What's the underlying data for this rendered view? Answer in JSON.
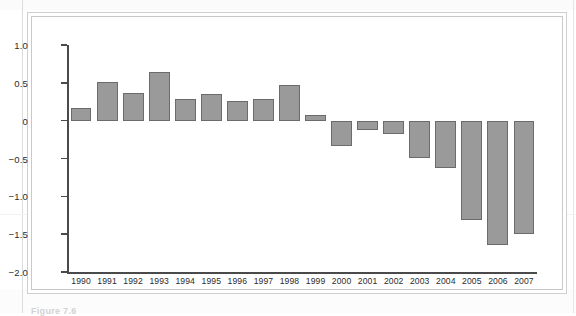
{
  "caption": "Figure 7.6",
  "colors": {
    "bar_fill": "#9a9a9a",
    "bar_stroke": "#6b6b6b",
    "axis": "#4a4a4a",
    "frame": "#cfcfcf",
    "text": "#2b2b2b",
    "page_background": "#ffffff"
  },
  "chart_data": {
    "type": "bar",
    "title": "",
    "subtitle": "",
    "xlabel": "",
    "ylabel": "",
    "categories": [
      "1990",
      "1991",
      "1992",
      "1993",
      "1994",
      "1995",
      "1996",
      "1997",
      "1998",
      "1999",
      "2000",
      "2001",
      "2002",
      "2003",
      "2004",
      "2005",
      "2006",
      "2007"
    ],
    "values": [
      0.17,
      0.51,
      0.36,
      0.64,
      0.29,
      0.35,
      0.26,
      0.28,
      0.47,
      0.08,
      -0.33,
      -0.13,
      -0.18,
      -0.5,
      -0.62,
      -1.31,
      -1.64,
      -1.5
    ],
    "ylim": [
      -2.0,
      1.0
    ],
    "yticks": [
      1.0,
      0.5,
      0,
      -0.5,
      -1.0,
      -1.5,
      -2.0
    ],
    "ytick_labels": [
      "1.0",
      "0.5",
      "0",
      "−0.5",
      "−1.0",
      "−1.5",
      "−2.0"
    ],
    "grid": false,
    "legend": null,
    "legend_position": "none",
    "baseline": 0,
    "annotations": []
  }
}
